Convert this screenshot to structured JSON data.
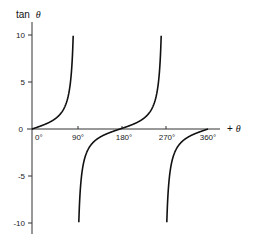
{
  "chart_data": {
    "type": "line",
    "title": "",
    "ylabel": "tan θ",
    "xlabel": "+θ",
    "ylabel_prefix": "tan",
    "theta_symbol": "θ",
    "xlabel_prefix": "+",
    "x_ticks": [
      "0°",
      "90°",
      "180°",
      "270°",
      "360°"
    ],
    "y_ticks": [
      "10",
      "5",
      "0",
      "-5",
      "-10"
    ],
    "xlim": [
      0,
      360
    ],
    "ylim": [
      -10,
      10
    ],
    "grid": false,
    "legend": "none",
    "series": [
      {
        "name": "tan θ",
        "function": "tan(theta)",
        "x": [
          0,
          15,
          30,
          45,
          60,
          75,
          84,
          90,
          96,
          105,
          120,
          135,
          150,
          165,
          180,
          195,
          210,
          225,
          240,
          255,
          264,
          270,
          276,
          285,
          300,
          315,
          330,
          345,
          360
        ],
        "values": [
          0,
          0.27,
          0.58,
          1,
          1.73,
          3.73,
          9.51,
          10,
          -10,
          -3.73,
          -1.73,
          -1,
          -0.58,
          -0.27,
          0,
          0.27,
          0.58,
          1,
          1.73,
          3.73,
          9.51,
          10,
          -10,
          -3.73,
          -1.73,
          -1,
          -0.58,
          -0.27,
          0
        ],
        "asymptotes": [
          90,
          270
        ],
        "clipped_range": [
          -10,
          10
        ]
      }
    ]
  }
}
